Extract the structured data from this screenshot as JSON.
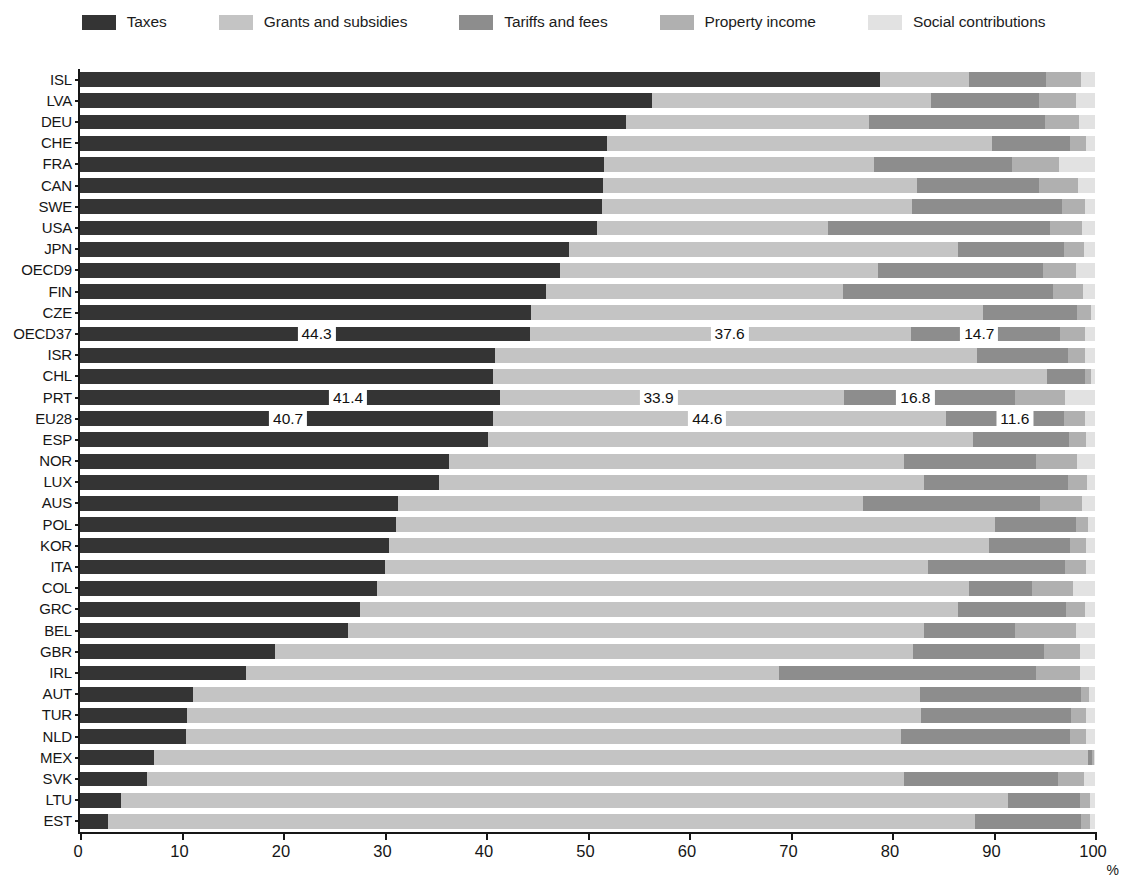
{
  "legend": {
    "items": [
      {
        "label": "Taxes",
        "color": "#343434",
        "icon": "legend-swatch-taxes"
      },
      {
        "label": "Grants and subsidies",
        "color": "#c4c4c4",
        "icon": "legend-swatch-grants"
      },
      {
        "label": "Tariffs and fees",
        "color": "#8d8d8d",
        "icon": "legend-swatch-tariffs"
      },
      {
        "label": "Property income",
        "color": "#b0b0b0",
        "icon": "legend-swatch-property"
      },
      {
        "label": "Social contributions",
        "color": "#e2e2e2",
        "icon": "legend-swatch-social"
      }
    ]
  },
  "axis": {
    "x_ticks": [
      "0",
      "10",
      "20",
      "30",
      "40",
      "50",
      "60",
      "70",
      "80",
      "90",
      "100"
    ],
    "x_unit": "%"
  },
  "chart_data": {
    "type": "bar",
    "orientation": "horizontal",
    "stacked": true,
    "normalized": true,
    "title": "",
    "xlabel": "%",
    "ylabel": "",
    "xlim": [
      0,
      100
    ],
    "grid": false,
    "legend_position": "top",
    "series": [
      {
        "name": "Taxes",
        "color": "#343434"
      },
      {
        "name": "Grants and subsidies",
        "color": "#c4c4c4"
      },
      {
        "name": "Tariffs and fees",
        "color": "#8d8d8d"
      },
      {
        "name": "Property income",
        "color": "#b0b0b0"
      },
      {
        "name": "Social contributions",
        "color": "#e2e2e2"
      }
    ],
    "categories": [
      "ISL",
      "LVA",
      "DEU",
      "CHE",
      "FRA",
      "CAN",
      "SWE",
      "USA",
      "JPN",
      "OECD9",
      "FIN",
      "CZE",
      "OECD37",
      "ISR",
      "CHL",
      "PRT",
      "EU28",
      "ESP",
      "NOR",
      "LUX",
      "AUS",
      "POL",
      "KOR",
      "ITA",
      "COL",
      "GRC",
      "BEL",
      "GBR",
      "IRL",
      "AUT",
      "TUR",
      "NLD",
      "MEX",
      "SVK",
      "LTU",
      "EST"
    ],
    "rows": [
      {
        "label": "ISL",
        "values": [
          78.8,
          8.8,
          7.6,
          3.4,
          1.4
        ]
      },
      {
        "label": "LVA",
        "values": [
          56.4,
          27.4,
          10.7,
          3.6,
          1.9
        ]
      },
      {
        "label": "DEU",
        "values": [
          53.8,
          23.9,
          17.4,
          3.3,
          1.6
        ]
      },
      {
        "label": "CHE",
        "values": [
          51.9,
          38.0,
          7.6,
          1.6,
          0.9
        ]
      },
      {
        "label": "FRA",
        "values": [
          51.6,
          26.6,
          13.6,
          4.7,
          3.5
        ]
      },
      {
        "label": "CAN",
        "values": [
          51.5,
          31.0,
          12.0,
          3.8,
          1.7
        ]
      },
      {
        "label": "SWE",
        "values": [
          51.4,
          30.6,
          14.7,
          2.3,
          1.0
        ]
      },
      {
        "label": "USA",
        "values": [
          50.9,
          22.8,
          21.9,
          3.1,
          1.3
        ]
      },
      {
        "label": "JPN",
        "values": [
          48.2,
          38.3,
          10.4,
          2.0,
          1.1
        ]
      },
      {
        "label": "OECD9",
        "values": [
          47.3,
          31.3,
          16.3,
          3.2,
          1.9
        ]
      },
      {
        "label": "FIN",
        "values": [
          45.9,
          29.3,
          20.7,
          2.9,
          1.2
        ]
      },
      {
        "label": "CZE",
        "values": [
          44.4,
          44.6,
          9.2,
          1.4,
          0.4
        ]
      },
      {
        "label": "OECD37",
        "values": [
          44.3,
          37.6,
          14.7,
          2.4,
          1.0
        ]
      },
      {
        "label": "ISR",
        "values": [
          40.9,
          47.5,
          8.9,
          1.7,
          1.0
        ]
      },
      {
        "label": "CHL",
        "values": [
          40.7,
          54.6,
          3.7,
          0.6,
          0.4
        ]
      },
      {
        "label": "PRT",
        "values": [
          41.4,
          33.9,
          16.8,
          4.9,
          3.0
        ]
      },
      {
        "label": "EU28",
        "values": [
          40.7,
          44.6,
          11.6,
          2.1,
          1.0
        ]
      },
      {
        "label": "ESP",
        "values": [
          40.2,
          47.8,
          9.4,
          1.7,
          0.9
        ]
      },
      {
        "label": "NOR",
        "values": [
          36.4,
          44.8,
          13.0,
          4.0,
          1.8
        ]
      },
      {
        "label": "LUX",
        "values": [
          35.4,
          47.8,
          14.1,
          1.9,
          0.8
        ]
      },
      {
        "label": "AUS",
        "values": [
          31.3,
          45.8,
          17.5,
          4.1,
          1.3
        ]
      },
      {
        "label": "POL",
        "values": [
          31.1,
          59.0,
          8.0,
          1.2,
          0.7
        ]
      },
      {
        "label": "KOR",
        "values": [
          30.4,
          59.2,
          7.9,
          1.6,
          0.9
        ]
      },
      {
        "label": "ITA",
        "values": [
          30.0,
          53.5,
          13.5,
          2.1,
          0.9
        ]
      },
      {
        "label": "COL",
        "values": [
          29.3,
          58.3,
          6.2,
          4.0,
          2.2
        ]
      },
      {
        "label": "GRC",
        "values": [
          27.6,
          58.9,
          10.6,
          1.9,
          1.0
        ]
      },
      {
        "label": "BEL",
        "values": [
          26.4,
          56.8,
          8.9,
          6.0,
          1.9
        ]
      },
      {
        "label": "GBR",
        "values": [
          19.2,
          62.9,
          12.9,
          3.5,
          1.5
        ]
      },
      {
        "label": "IRL",
        "values": [
          16.4,
          52.5,
          25.3,
          4.3,
          1.5
        ]
      },
      {
        "label": "AUT",
        "values": [
          11.1,
          71.7,
          15.8,
          0.8,
          0.6
        ]
      },
      {
        "label": "TUR",
        "values": [
          10.5,
          72.4,
          14.7,
          1.5,
          0.9
        ]
      },
      {
        "label": "NLD",
        "values": [
          10.4,
          70.5,
          16.6,
          1.6,
          0.9
        ]
      },
      {
        "label": "MEX",
        "values": [
          7.3,
          92.0,
          0.4,
          0.2,
          0.1
        ]
      },
      {
        "label": "SVK",
        "values": [
          6.6,
          74.6,
          15.2,
          2.5,
          1.1
        ]
      },
      {
        "label": "LTU",
        "values": [
          4.0,
          87.4,
          7.1,
          1.0,
          0.5
        ]
      },
      {
        "label": "EST",
        "values": [
          2.8,
          85.4,
          10.4,
          0.9,
          0.5
        ]
      }
    ],
    "value_labels": [
      {
        "row": "OECD37",
        "series": "Taxes",
        "text": "44.3",
        "x_pct": 23.5
      },
      {
        "row": "OECD37",
        "series": "Grants and subsidies",
        "text": "37.6",
        "x_pct": 64.2
      },
      {
        "row": "OECD37",
        "series": "Tariffs and fees",
        "text": "14.7",
        "x_pct": 88.8
      },
      {
        "row": "PRT",
        "series": "Taxes",
        "text": "41.4",
        "x_pct": 26.6
      },
      {
        "row": "PRT",
        "series": "Grants and subsidies",
        "text": "33.9",
        "x_pct": 57.2
      },
      {
        "row": "PRT",
        "series": "Tariffs and fees",
        "text": "16.8",
        "x_pct": 82.5
      },
      {
        "row": "EU28",
        "series": "Taxes",
        "text": "40.7",
        "x_pct": 20.7
      },
      {
        "row": "EU28",
        "series": "Grants and subsidies",
        "text": "44.6",
        "x_pct": 62.0
      },
      {
        "row": "EU28",
        "series": "Tariffs and fees",
        "text": "11.6",
        "x_pct": 92.3
      }
    ]
  }
}
